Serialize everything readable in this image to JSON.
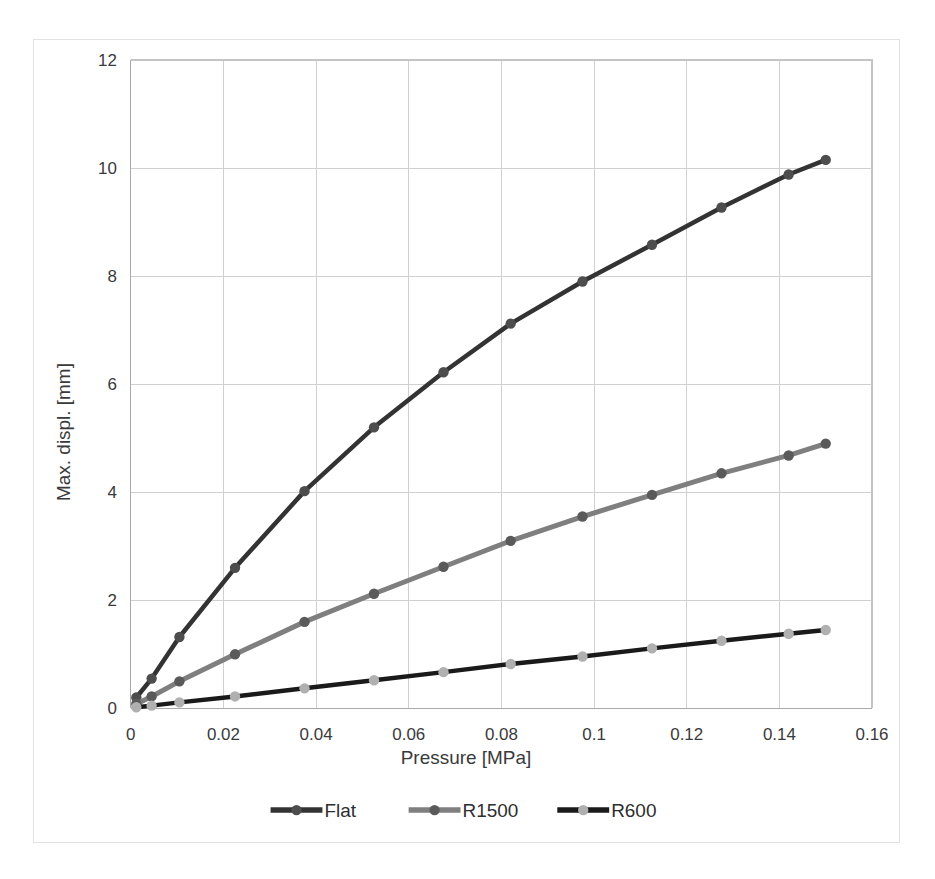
{
  "chart_data": {
    "type": "line",
    "title": "",
    "xlabel": "Pressure [MPa]",
    "ylabel": "Max. displ. [mm]",
    "xlim": [
      0,
      0.16
    ],
    "ylim": [
      0,
      12
    ],
    "xticks": [
      "0",
      "0.02",
      "0.04",
      "0.06",
      "0.08",
      "0.1",
      "0.12",
      "0.14",
      "0.16"
    ],
    "xtick_values": [
      0,
      0.02,
      0.04,
      0.06,
      0.08,
      0.1,
      0.12,
      0.14,
      0.16
    ],
    "yticks": [
      "0",
      "2",
      "4",
      "6",
      "8",
      "10",
      "12"
    ],
    "ytick_values": [
      0,
      2,
      4,
      6,
      8,
      10,
      12
    ],
    "grid": true,
    "legend_position": "bottom",
    "x": [
      0.0012,
      0.0045,
      0.0105,
      0.0225,
      0.0375,
      0.0525,
      0.0675,
      0.082,
      0.0975,
      0.1125,
      0.1275,
      0.142,
      0.15
    ],
    "series": [
      {
        "name": "Flat",
        "color": "#333333",
        "marker_color": "#4d4d4d",
        "values": [
          0.2,
          0.55,
          1.32,
          2.6,
          4.02,
          5.2,
          6.22,
          7.12,
          7.9,
          8.58,
          9.27,
          9.88,
          10.15
        ]
      },
      {
        "name": "R1500",
        "color": "#7f7f7f",
        "marker_color": "#5a5a5a",
        "values": [
          0.08,
          0.22,
          0.5,
          1.0,
          1.6,
          2.12,
          2.62,
          3.1,
          3.55,
          3.95,
          4.35,
          4.68,
          4.9
        ]
      },
      {
        "name": "R600",
        "color": "#1a1a1a",
        "marker_color": "#b0b0b0",
        "values": [
          0.02,
          0.05,
          0.11,
          0.22,
          0.37,
          0.52,
          0.67,
          0.82,
          0.96,
          1.11,
          1.25,
          1.38,
          1.45
        ]
      }
    ]
  }
}
